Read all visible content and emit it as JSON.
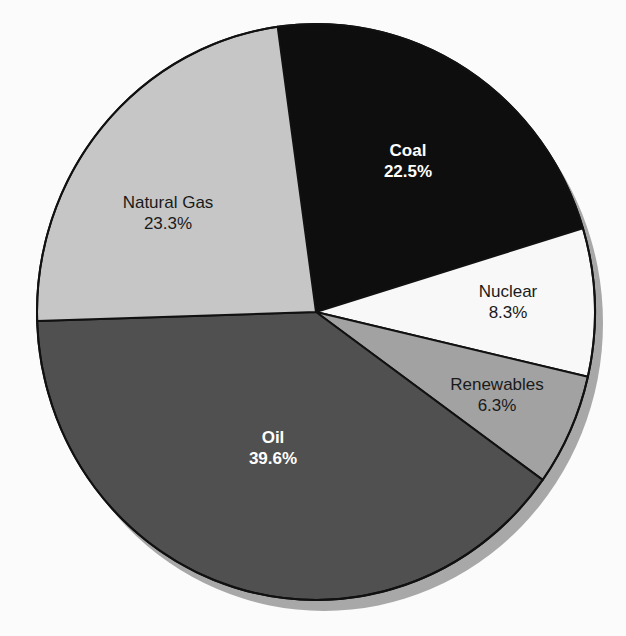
{
  "chart_data": {
    "type": "pie",
    "title": "",
    "slices": [
      {
        "label": "Coal",
        "value": 22.5,
        "display": "22.5%",
        "fill": "#0e0e0e",
        "text_color": "#ffffff",
        "bold": true,
        "label_pos": [
          408,
          161
        ]
      },
      {
        "label": "Nuclear",
        "value": 8.3,
        "display": "8.3%",
        "fill": "#f8f8f8",
        "text_color": "#1a1a1a",
        "bold": false,
        "label_pos": [
          508,
          302
        ]
      },
      {
        "label": "Renewables",
        "value": 6.3,
        "display": "6.3%",
        "fill": "#a2a2a2",
        "text_color": "#1a1a1a",
        "bold": false,
        "label_pos": [
          497,
          395
        ]
      },
      {
        "label": "Oil",
        "value": 39.6,
        "display": "39.6%",
        "fill": "#505050",
        "text_color": "#ffffff",
        "bold": true,
        "label_pos": [
          273,
          448
        ]
      },
      {
        "label": "Natural Gas",
        "value": 23.3,
        "display": "23.3%",
        "fill": "#c6c6c6",
        "text_color": "#1a1a1a",
        "bold": false,
        "label_pos": [
          168,
          213
        ]
      }
    ],
    "start_angle_deg": -7.9,
    "center": [
      316,
      312
    ],
    "radius_x": 279,
    "radius_y": 288,
    "shadow_color": "#a8a8a8",
    "legend": "none"
  },
  "labels": {
    "coal": {
      "name": "Coal",
      "pct": "22.5%"
    },
    "nuclear": {
      "name": "Nuclear",
      "pct": "8.3%"
    },
    "renewables": {
      "name": "Renewables",
      "pct": "6.3%"
    },
    "oil": {
      "name": "Oil",
      "pct": "39.6%"
    },
    "natural_gas": {
      "name": "Natural Gas",
      "pct": "23.3%"
    }
  }
}
